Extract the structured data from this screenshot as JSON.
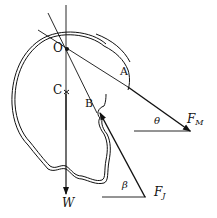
{
  "diagram": {
    "type": "free-body diagram of skull / head",
    "points": {
      "O": "O",
      "C": "C",
      "A": "A",
      "B": "B"
    },
    "forces": {
      "W": "W",
      "FM_main": "F",
      "FM_sub": "M",
      "FJ_main": "F",
      "FJ_sub": "J"
    },
    "angles": {
      "theta": "θ",
      "beta": "β"
    },
    "colors": {
      "ink": "#111111",
      "background": "#ffffff"
    }
  }
}
